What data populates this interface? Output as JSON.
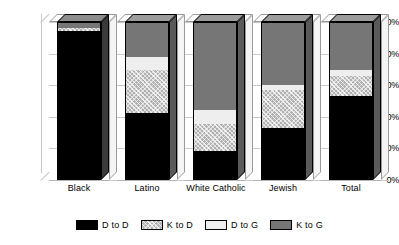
{
  "chart_data": {
    "type": "bar",
    "subtype": "stacked-column-3d",
    "title": "",
    "xlabel": "",
    "ylabel": "",
    "ylim": [
      0,
      100
    ],
    "yunit": "%",
    "grid": true,
    "legend_position": "bottom",
    "categories": [
      "Black",
      "Latino",
      "White Catholic",
      "Jewish",
      "Total"
    ],
    "ytick_labels": [
      "0%",
      "20%",
      "40%",
      "60%",
      "80%",
      "100%"
    ],
    "ytick_values": [
      0,
      20,
      40,
      60,
      80,
      100
    ],
    "series": [
      {
        "name": "D to D",
        "key": "dd",
        "color": "#000000",
        "values": [
          95,
          42,
          18,
          33,
          53
        ]
      },
      {
        "name": "K to D",
        "key": "kd",
        "color": "#b0b0b0",
        "values": [
          2,
          28,
          17,
          24,
          13
        ]
      },
      {
        "name": "D to G",
        "key": "dg",
        "color": "#eeeeee",
        "values": [
          0,
          8,
          9,
          3,
          4
        ]
      },
      {
        "name": "K to G",
        "key": "kg",
        "color": "#767676",
        "values": [
          3,
          22,
          56,
          40,
          30
        ]
      }
    ]
  }
}
